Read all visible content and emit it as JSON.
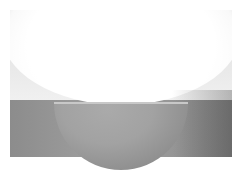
{
  "image": {
    "subject": "half-dome wall sconce light fixture",
    "description": "Gray half-sphere wall sconce emitting bright white light upward onto a gray wall",
    "colors": {
      "wall": "#9a9a9a",
      "glow": "#ffffff",
      "fixture": "#a0a0a0",
      "frame_background": "#ffffff"
    }
  }
}
